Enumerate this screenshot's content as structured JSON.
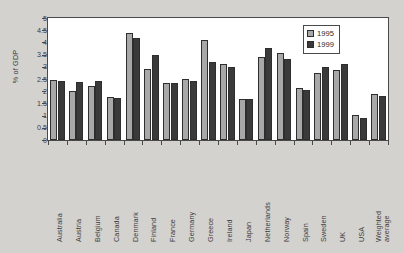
{
  "chart_data": {
    "type": "bar",
    "title": "",
    "xlabel": "",
    "ylabel": "% of GDP",
    "ylim": [
      0,
      5
    ],
    "ytick_step": 0.5,
    "grid": false,
    "legend_position": "top-right",
    "categories": [
      "Australia",
      "Austria",
      "Belgium",
      "Canada",
      "Denmark",
      "Finland",
      "France",
      "Germany",
      "Greece",
      "Ireland",
      "Japan",
      "Netherlands",
      "Norway",
      "Spain",
      "Sweden",
      "UK",
      "USA",
      "Weighted average"
    ],
    "yticks": [
      "0",
      "0.5",
      "1",
      "1.5",
      "2",
      "2.5",
      "3",
      "3.5",
      "4",
      "4.5",
      "5"
    ],
    "series": [
      {
        "name": "1995",
        "color": "#a8a8a8",
        "values": [
          2.45,
          2.0,
          2.2,
          1.75,
          4.4,
          2.93,
          2.33,
          2.5,
          4.1,
          3.1,
          1.68,
          3.4,
          3.58,
          2.15,
          2.75,
          2.88,
          1.02,
          1.88
        ]
      },
      {
        "name": "1999",
        "color": "#3a3a3a",
        "values": [
          2.42,
          2.37,
          2.42,
          1.72,
          4.2,
          3.5,
          2.33,
          2.4,
          3.19,
          3.0,
          1.68,
          3.78,
          3.34,
          2.06,
          2.98,
          3.13,
          0.9,
          1.81
        ]
      }
    ],
    "legend": [
      {
        "label": "1995",
        "color": "#a8a8a8"
      },
      {
        "label": "1999",
        "color": "#3a3a3a"
      }
    ]
  },
  "colors": {
    "page_background": "#d4d2cf",
    "plot_background": "#ffffff",
    "axis": "#4a4a4a",
    "text": "#3b3b3b",
    "series_1995": "#a8a8a8",
    "series_1999": "#3a3a3a"
  }
}
